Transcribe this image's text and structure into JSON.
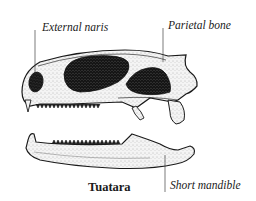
{
  "figure": {
    "caption": "Tuatara",
    "labels": {
      "external_naris": "External naris",
      "parietal_bone": "Parietal bone",
      "short_mandible": "Short mandible"
    }
  },
  "colors": {
    "ink": "#1a1a1a",
    "bone": "#f2f2f2",
    "opening": "#141414",
    "background": "#ffffff"
  }
}
